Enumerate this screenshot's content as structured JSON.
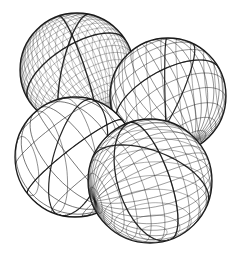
{
  "figure": {
    "background": "#ffffff",
    "stroke_color": "#1a1a1a",
    "spheres": [
      {
        "name": "dense-geodesic-sphere",
        "cx": 77,
        "cy": 70,
        "r": 57,
        "lat": 24,
        "lon": 30,
        "tilt": -20,
        "weight": 0.35,
        "major_weight": 1.4
      },
      {
        "name": "top-right-geodesic-sphere",
        "cx": 168,
        "cy": 96,
        "r": 58,
        "lat": 12,
        "lon": 16,
        "tilt": 10,
        "weight": 0.55,
        "major_weight": 1.2
      },
      {
        "name": "sparse-geodesic-sphere",
        "cx": 75,
        "cy": 157,
        "r": 60,
        "lat": 6,
        "lon": 8,
        "tilt": 25,
        "weight": 0.7,
        "major_weight": 1.2
      },
      {
        "name": "bottom-right-geodesic-sphere",
        "cx": 150,
        "cy": 181,
        "r": 62,
        "lat": 14,
        "lon": 18,
        "tilt": -30,
        "weight": 0.5,
        "major_weight": 1.3
      }
    ]
  }
}
